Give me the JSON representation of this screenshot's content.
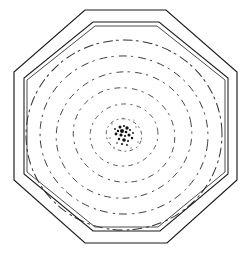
{
  "figure": {
    "background_color": "#ffffff",
    "ink_color": "#1b1b1b",
    "canvas": {
      "width": 251,
      "height": 259
    },
    "center": {
      "x": 124,
      "y": 135
    }
  },
  "frame": {
    "outer_octagon": {
      "label": "outer octagon",
      "points": "85,10 166,10 237,72 237,180 167,243 85,243 14,180 14,72",
      "stroke_width": 1.15
    },
    "inner_octagon_a": {
      "label": "inner octagon outer line",
      "points": "93,22 159,22 228,78 228,174 160,231 93,231 24,174 24,78",
      "stroke_width": 1.05
    },
    "inner_octagon_b": {
      "label": "inner octagon inner line",
      "points": "95,26 157,26 225,80 225,172 158,227 95,227 27,172 27,80",
      "stroke_width": 0.85
    }
  },
  "contours": {
    "label": "concentric contour rings",
    "count": 6,
    "style": "dashed-stippled",
    "rings": [
      {
        "name": "ring-1-outermost",
        "rx": 98,
        "ry": 95,
        "rotation": -4,
        "stroke_width": 1.0,
        "dash": "9 4 2 5",
        "opacity": 0.92
      },
      {
        "name": "ring-2",
        "rx": 84,
        "ry": 79,
        "rotation": 6,
        "stroke_width": 0.95,
        "dash": "7 5 1.5 6",
        "opacity": 0.88
      },
      {
        "name": "ring-3",
        "rx": 68,
        "ry": 63,
        "rotation": -12,
        "stroke_width": 0.9,
        "dash": "6 5 1.5 6",
        "opacity": 0.85
      },
      {
        "name": "ring-4",
        "rx": 51,
        "ry": 47,
        "rotation": 14,
        "stroke_width": 0.9,
        "dash": "5 5 1.5 6",
        "opacity": 0.82
      },
      {
        "name": "ring-5",
        "rx": 34,
        "ry": 31,
        "rotation": -8,
        "stroke_width": 0.85,
        "dash": "4 5 1.5 5",
        "opacity": 0.8
      },
      {
        "name": "ring-6-innermost",
        "rx": 18,
        "ry": 16,
        "rotation": 20,
        "stroke_width": 0.85,
        "dash": "3 4 1 4",
        "opacity": 0.78
      }
    ]
  },
  "core": {
    "label": "central dense cluster",
    "color": "#111111",
    "specks": [
      {
        "x": 120,
        "y": 127,
        "r": 1.5
      },
      {
        "x": 124,
        "y": 126,
        "r": 1.1
      },
      {
        "x": 127,
        "y": 128,
        "r": 1.7
      },
      {
        "x": 118,
        "y": 131,
        "r": 1.2
      },
      {
        "x": 122,
        "y": 131,
        "r": 2.0
      },
      {
        "x": 126,
        "y": 132,
        "r": 1.3
      },
      {
        "x": 130,
        "y": 130,
        "r": 1.0
      },
      {
        "x": 116,
        "y": 134,
        "r": 1.4
      },
      {
        "x": 121,
        "y": 135,
        "r": 1.6
      },
      {
        "x": 125,
        "y": 136,
        "r": 1.1
      },
      {
        "x": 129,
        "y": 135,
        "r": 1.5
      },
      {
        "x": 119,
        "y": 139,
        "r": 1.2
      },
      {
        "x": 124,
        "y": 140,
        "r": 1.8
      },
      {
        "x": 128,
        "y": 141,
        "r": 1.0
      },
      {
        "x": 132,
        "y": 138,
        "r": 1.2
      },
      {
        "x": 115,
        "y": 129,
        "r": 0.9
      },
      {
        "x": 133,
        "y": 133,
        "r": 0.9
      },
      {
        "x": 122,
        "y": 144,
        "r": 1.1
      },
      {
        "x": 127,
        "y": 145,
        "r": 0.9
      },
      {
        "x": 117,
        "y": 143,
        "r": 0.8
      }
    ],
    "faint_specks": [
      {
        "x": 112,
        "y": 124,
        "r": 0.7
      },
      {
        "x": 136,
        "y": 127,
        "r": 0.7
      },
      {
        "x": 110,
        "y": 138,
        "r": 0.8
      },
      {
        "x": 138,
        "y": 142,
        "r": 0.7
      },
      {
        "x": 131,
        "y": 148,
        "r": 0.7
      },
      {
        "x": 114,
        "y": 148,
        "r": 0.6
      },
      {
        "x": 123,
        "y": 118,
        "r": 0.6
      },
      {
        "x": 134,
        "y": 120,
        "r": 0.6
      }
    ]
  }
}
